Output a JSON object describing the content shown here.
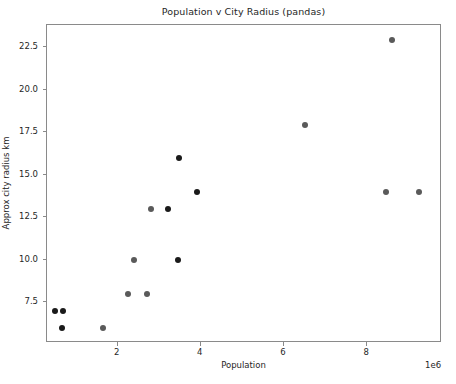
{
  "chart_data": {
    "type": "scatter",
    "title": "Population v City Radius (pandas)",
    "xlabel": "Population",
    "ylabel": "Approx city radius km",
    "x_offset_text": "1e6",
    "xlim": [
      300000,
      9800000
    ],
    "ylim": [
      5.1,
      23.8
    ],
    "grid": false,
    "legend": null,
    "marker": {
      "shape": "circle",
      "size_px": 6,
      "color_light": "#5a5a5a",
      "color_dark": "#1a1a1a"
    },
    "xticks": [
      2000000,
      4000000,
      6000000,
      8000000
    ],
    "xtick_labels": [
      "2",
      "4",
      "6",
      "8"
    ],
    "yticks": [
      7.5,
      10.0,
      12.5,
      15.0,
      17.5,
      20.0,
      22.5
    ],
    "ytick_labels": [
      "7.5",
      "10.0",
      "12.5",
      "15.0",
      "17.5",
      "20.0",
      "22.5"
    ],
    "points": [
      {
        "x": 500000,
        "y": 7.0,
        "shade": "dark"
      },
      {
        "x": 680000,
        "y": 7.0,
        "shade": "dark"
      },
      {
        "x": 660000,
        "y": 6.0,
        "shade": "dark"
      },
      {
        "x": 1650000,
        "y": 6.0,
        "shade": "light"
      },
      {
        "x": 2250000,
        "y": 8.0,
        "shade": "light"
      },
      {
        "x": 2700000,
        "y": 8.0,
        "shade": "light"
      },
      {
        "x": 2400000,
        "y": 10.0,
        "shade": "light"
      },
      {
        "x": 3450000,
        "y": 10.0,
        "shade": "dark"
      },
      {
        "x": 2800000,
        "y": 13.0,
        "shade": "light"
      },
      {
        "x": 3200000,
        "y": 13.0,
        "shade": "dark"
      },
      {
        "x": 3470000,
        "y": 16.0,
        "shade": "dark"
      },
      {
        "x": 3900000,
        "y": 14.0,
        "shade": "dark"
      },
      {
        "x": 6500000,
        "y": 17.9,
        "shade": "light"
      },
      {
        "x": 8600000,
        "y": 22.9,
        "shade": "light"
      },
      {
        "x": 8450000,
        "y": 14.0,
        "shade": "light"
      },
      {
        "x": 9250000,
        "y": 14.0,
        "shade": "light"
      }
    ]
  }
}
